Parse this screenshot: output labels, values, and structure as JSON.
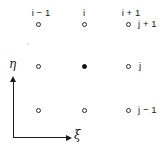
{
  "figure": {
    "type": "stencil-grid-diagram",
    "background_color": "#ffffff",
    "ink_color": "#1a1a1a"
  },
  "column_labels": [
    {
      "text": "i − 1",
      "x": 41,
      "y": 8
    },
    {
      "text": "i",
      "x": 84,
      "y": 8
    },
    {
      "text": "i + 1",
      "x": 131,
      "y": 8
    }
  ],
  "row_labels": [
    {
      "text": "j + 1",
      "x": 138,
      "y": 19
    },
    {
      "text": "j",
      "x": 139,
      "y": 61
    },
    {
      "text": "j − 1",
      "x": 138,
      "y": 105
    }
  ],
  "nodes": [
    {
      "name": "node-im1-jp1",
      "i": "i-1",
      "j": "j+1",
      "x": 38,
      "y": 24,
      "style": "open"
    },
    {
      "name": "node-i-jp1",
      "i": "i",
      "j": "j+1",
      "x": 84,
      "y": 24,
      "style": "open"
    },
    {
      "name": "node-ip1-jp1",
      "i": "i+1",
      "j": "j+1",
      "x": 128,
      "y": 24,
      "style": "open"
    },
    {
      "name": "node-im1-j",
      "i": "i-1",
      "j": "j",
      "x": 38,
      "y": 66,
      "style": "open"
    },
    {
      "name": "node-i-j",
      "i": "i",
      "j": "j",
      "x": 84,
      "y": 66,
      "style": "filled"
    },
    {
      "name": "node-ip1-j",
      "i": "i+1",
      "j": "j",
      "x": 128,
      "y": 66,
      "style": "open"
    },
    {
      "name": "node-im1-jm1",
      "i": "i-1",
      "j": "j-1",
      "x": 38,
      "y": 110,
      "style": "open"
    },
    {
      "name": "node-i-jm1",
      "i": "i",
      "j": "j-1",
      "x": 84,
      "y": 110,
      "style": "open"
    },
    {
      "name": "node-ip1-jm1",
      "i": "i+1",
      "j": "j-1",
      "x": 128,
      "y": 110,
      "style": "open"
    }
  ],
  "axes": {
    "vertical": {
      "label": "η",
      "label_x": 9,
      "label_y": 58,
      "line_x": 13,
      "line_top": 82,
      "line_bottom": 138,
      "arrow_x": 10,
      "arrow_y": 76
    },
    "horizontal": {
      "label": "ξ",
      "label_x": 74,
      "label_y": 129,
      "line_y": 137,
      "line_left": 13,
      "line_right": 66,
      "arrow_x": 66,
      "arrow_y": 135
    }
  },
  "artifacts": [
    {
      "name": "scan-speck",
      "x": 27,
      "y": 43
    }
  ]
}
